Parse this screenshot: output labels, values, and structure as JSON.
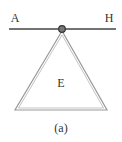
{
  "figure": {
    "caption": "(a)",
    "labels": {
      "left_end": "A",
      "right_end": "H",
      "body": "E"
    },
    "colors": {
      "bar": "#444444",
      "triangle_outline": "#999999",
      "pivot": "#555555",
      "text": "#333333"
    }
  }
}
